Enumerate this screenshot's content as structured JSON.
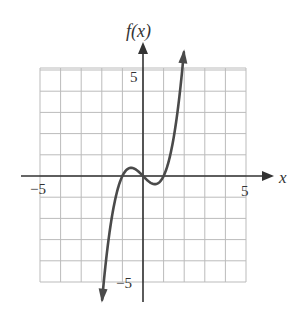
{
  "chart_data": {
    "type": "line",
    "title": "",
    "xlabel": "x",
    "ylabel": "f(x)",
    "xlim": [
      -5,
      5
    ],
    "ylim": [
      -5,
      5
    ],
    "grid": true,
    "grid_step": 1,
    "x_tick_labels": [
      {
        "value": -5,
        "label": "−5"
      },
      {
        "value": 5,
        "label": "5"
      }
    ],
    "y_tick_labels": [
      {
        "value": 5,
        "label": "5"
      },
      {
        "value": -5,
        "label": "−5"
      }
    ],
    "series": [
      {
        "name": "f(x)",
        "description": "cubic curve with local max near (-0.58, 0.38) and local min near (0.58, -0.38), zeros at -1, 0, 1, arrows at both ends",
        "x": [
          -2.0,
          -1.75,
          -1.5,
          -1.25,
          -1.0,
          -0.75,
          -0.58,
          -0.5,
          -0.25,
          0.0,
          0.25,
          0.5,
          0.58,
          0.75,
          1.0,
          1.25,
          1.5,
          1.75,
          2.0
        ],
        "values": [
          -6.0,
          -3.61,
          -1.88,
          -0.7,
          0.0,
          0.33,
          0.38,
          0.38,
          0.23,
          0.0,
          -0.23,
          -0.38,
          -0.38,
          -0.33,
          0.0,
          0.7,
          1.88,
          3.61,
          6.0
        ]
      }
    ],
    "colors": {
      "curve": "#4a4a4a",
      "axis": "#333333",
      "grid": "#bbbbbb"
    }
  },
  "labels": {
    "x_axis": "x",
    "y_axis": "f(x)",
    "x_min": "−5",
    "x_max": "5",
    "y_max": "5",
    "y_min": "−5"
  }
}
